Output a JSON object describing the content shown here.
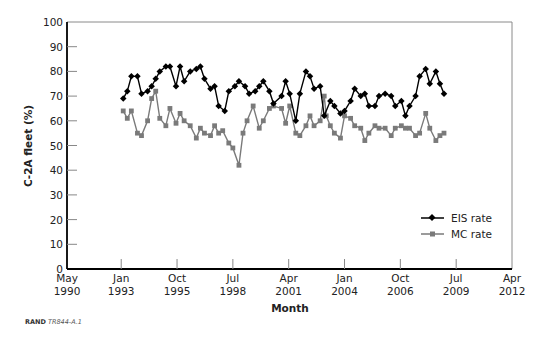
{
  "chart_data": {
    "type": "line",
    "title": "",
    "xlabel": "Month",
    "ylabel": "C-2A fleet (%)",
    "ylim": [
      0,
      100
    ],
    "yticks": [
      0,
      10,
      20,
      30,
      40,
      50,
      60,
      70,
      80,
      90,
      100
    ],
    "xlim": [
      1990.33,
      2012.25
    ],
    "xticks": [
      {
        "pos": 1990.33,
        "label1": "May",
        "label2": "1990"
      },
      {
        "pos": 1993.0,
        "label1": "Jan",
        "label2": "1993"
      },
      {
        "pos": 1995.75,
        "label1": "Oct",
        "label2": "1995"
      },
      {
        "pos": 1998.5,
        "label1": "Jul",
        "label2": "1998"
      },
      {
        "pos": 2001.25,
        "label1": "Apr",
        "label2": "2001"
      },
      {
        "pos": 2004.0,
        "label1": "Jan",
        "label2": "2004"
      },
      {
        "pos": 2006.75,
        "label1": "Oct",
        "label2": "2006"
      },
      {
        "pos": 2009.5,
        "label1": "Jul",
        "label2": "2009"
      },
      {
        "pos": 2012.25,
        "label1": "Apr",
        "label2": "2012"
      }
    ],
    "grid": false,
    "legend_position": "lower right",
    "series": [
      {
        "name": "EIS rate",
        "color": "#000000",
        "marker": "diamond",
        "x": [
          1993.1,
          1993.3,
          1993.5,
          1993.8,
          1994.0,
          1994.3,
          1994.5,
          1994.7,
          1994.9,
          1995.2,
          1995.4,
          1995.7,
          1995.9,
          1996.1,
          1996.4,
          1996.7,
          1996.9,
          1997.1,
          1997.4,
          1997.6,
          1997.8,
          1998.1,
          1998.3,
          1998.6,
          1998.8,
          1999.1,
          1999.3,
          1999.6,
          1999.8,
          2000.0,
          2000.3,
          2000.5,
          2000.9,
          2001.1,
          2001.3,
          2001.6,
          2001.8,
          2002.1,
          2002.3,
          2002.5,
          2002.8,
          2003.0,
          2003.3,
          2003.5,
          2003.8,
          2004.0,
          2004.3,
          2004.5,
          2004.8,
          2005.0,
          2005.2,
          2005.5,
          2005.7,
          2006.0,
          2006.3,
          2006.5,
          2006.8,
          2007.0,
          2007.2,
          2007.5,
          2007.7,
          2008.0,
          2008.2,
          2008.5,
          2008.7,
          2008.9
        ],
        "values": [
          69,
          72,
          78,
          78,
          71,
          72,
          74,
          77,
          80,
          82,
          82,
          74,
          82,
          76,
          80,
          81,
          82,
          77,
          73,
          74,
          66,
          64,
          72,
          74,
          76,
          74,
          71,
          72,
          74,
          76,
          72,
          67,
          70,
          76,
          71,
          60,
          71,
          80,
          78,
          73,
          74,
          62,
          68,
          66,
          63,
          64,
          68,
          73,
          70,
          71,
          66,
          66,
          70,
          71,
          70,
          66,
          68,
          62,
          66,
          70,
          78,
          81,
          75,
          80,
          75,
          71
        ]
      },
      {
        "name": "MC rate",
        "color": "#7a7a7a",
        "marker": "square",
        "x": [
          1993.1,
          1993.3,
          1993.5,
          1993.8,
          1994.0,
          1994.3,
          1994.5,
          1994.7,
          1994.9,
          1995.2,
          1995.4,
          1995.7,
          1995.9,
          1996.1,
          1996.4,
          1996.7,
          1996.9,
          1997.1,
          1997.4,
          1997.6,
          1997.8,
          1998.0,
          1998.3,
          1998.5,
          1998.8,
          1999.0,
          1999.2,
          1999.5,
          1999.8,
          2000.0,
          2000.3,
          2000.5,
          2000.9,
          2001.1,
          2001.3,
          2001.6,
          2001.8,
          2002.1,
          2002.3,
          2002.5,
          2002.8,
          2003.0,
          2003.1,
          2003.3,
          2003.5,
          2003.8,
          2004.0,
          2004.3,
          2004.5,
          2004.8,
          2005.0,
          2005.2,
          2005.5,
          2005.7,
          2006.0,
          2006.3,
          2006.5,
          2006.8,
          2007.0,
          2007.2,
          2007.5,
          2007.7,
          2008.0,
          2008.2,
          2008.5,
          2008.7,
          2008.9
        ],
        "values": [
          64,
          61,
          64,
          55,
          54,
          60,
          69,
          72,
          61,
          58,
          65,
          59,
          63,
          60,
          58,
          53,
          57,
          55,
          54,
          58,
          55,
          56,
          51,
          49,
          42,
          55,
          60,
          66,
          57,
          60,
          65,
          66,
          65,
          59,
          66,
          55,
          54,
          58,
          62,
          58,
          60,
          70,
          62,
          58,
          55,
          53,
          62,
          61,
          58,
          57,
          52,
          55,
          58,
          57,
          57,
          54,
          57,
          58,
          57,
          57,
          54,
          55,
          63,
          57,
          52,
          54,
          55
        ]
      }
    ],
    "legend": [
      {
        "label": "EIS rate"
      },
      {
        "label": "MC rate"
      }
    ]
  },
  "credit": {
    "org": "RAND",
    "id": "TR844-A.1"
  }
}
